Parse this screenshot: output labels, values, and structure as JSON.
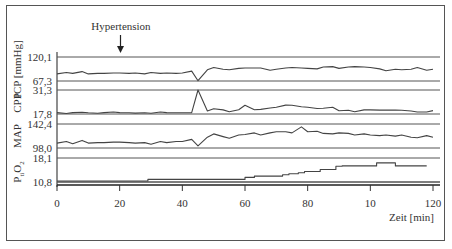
{
  "chart_data": {
    "type": "line",
    "title": "",
    "annotation": {
      "text": "Hypertension",
      "x": 20,
      "marker": "arrow-down"
    },
    "xlabel": "Zeit [min]",
    "x_ticks": [
      "0",
      "20",
      "40",
      "60",
      "80",
      "10",
      "120"
    ],
    "x_tick_values": [
      0,
      20,
      40,
      60,
      80,
      100,
      120
    ],
    "xlim": [
      0,
      120
    ],
    "ylabel_unit": "[mmHg]",
    "grid": "horizontal reference lines per panel",
    "legend": "none",
    "panels": [
      {
        "name": "ICP",
        "label": "ICP",
        "unit": "[mmHg]",
        "ymax": 120.1,
        "ymin": 67.3,
        "ymax_label": "120,1",
        "ymin_label": "67,3"
      },
      {
        "name": "CPP",
        "label": "CPP",
        "ymax": 31.3,
        "ymin": 17.8,
        "ymax_label": "31,3",
        "ymin_label": "17,8"
      },
      {
        "name": "MAP",
        "label": "MAP",
        "ymax": 142.4,
        "ymin": 98.0,
        "ymax_label": "142,4",
        "ymin_label": "98,0"
      },
      {
        "name": "PtiO2",
        "label": "PtiO2",
        "ymax": 18.1,
        "ymin": 10.8,
        "ymax_label": "18,1",
        "ymin_label": "10,8"
      }
    ],
    "series": [
      {
        "name": "ICP",
        "x": [
          0,
          3,
          5,
          8,
          10,
          13,
          15,
          18,
          20,
          23,
          25,
          28,
          30,
          33,
          35,
          38,
          40,
          43,
          45,
          48,
          50,
          53,
          55,
          58,
          60,
          63,
          65,
          68,
          70,
          73,
          75,
          78,
          80,
          83,
          85,
          88,
          90,
          93,
          95,
          98,
          100,
          103,
          105,
          108,
          110,
          113,
          115,
          118,
          120
        ],
        "values": [
          83,
          86,
          84,
          88,
          83,
          84,
          84,
          85,
          85,
          84,
          85,
          83,
          86,
          84,
          85,
          84,
          85,
          89,
          68,
          92,
          97,
          93,
          92,
          95,
          96,
          96,
          96,
          91,
          93,
          96,
          97,
          96,
          95,
          94,
          98,
          99,
          95,
          98,
          99,
          98,
          97,
          94,
          90,
          93,
          92,
          93,
          97,
          91,
          93
        ]
      },
      {
        "name": "CPP",
        "x": [
          0,
          3,
          5,
          8,
          10,
          13,
          15,
          18,
          20,
          23,
          25,
          28,
          30,
          33,
          35,
          38,
          40,
          43,
          45,
          48,
          50,
          53,
          55,
          58,
          60,
          63,
          65,
          68,
          70,
          73,
          75,
          78,
          80,
          83,
          85,
          88,
          90,
          93,
          95,
          98,
          100,
          103,
          105,
          108,
          110,
          113,
          115,
          118,
          120
        ],
        "values": [
          18.6,
          18.1,
          18.6,
          18.8,
          18.5,
          18.2,
          18.6,
          18.9,
          18.6,
          18.5,
          18.3,
          18.5,
          18.2,
          18.9,
          18.6,
          18.5,
          18.5,
          18.6,
          31.3,
          19.5,
          20.7,
          20.1,
          19.1,
          20.2,
          22.7,
          20.2,
          20.4,
          21.2,
          21.6,
          22.8,
          22.7,
          21.9,
          21.6,
          20.9,
          21.0,
          21.6,
          19.6,
          19.9,
          19.1,
          20.1,
          20.1,
          20.0,
          20.0,
          20.0,
          19.9,
          19.5,
          18.9,
          18.9,
          19.7
        ]
      },
      {
        "name": "MAP",
        "x": [
          0,
          3,
          5,
          8,
          10,
          13,
          15,
          18,
          20,
          23,
          25,
          28,
          30,
          33,
          35,
          38,
          40,
          43,
          45,
          48,
          50,
          53,
          55,
          58,
          60,
          63,
          65,
          68,
          70,
          73,
          75,
          78,
          80,
          83,
          85,
          88,
          90,
          93,
          95,
          98,
          100,
          103,
          105,
          108,
          110,
          113,
          115,
          118,
          120
        ],
        "values": [
          107,
          110,
          106,
          112,
          107,
          108,
          108,
          109,
          109,
          108,
          107,
          108,
          105,
          110,
          108,
          110,
          110,
          114,
          102,
          118,
          124,
          119,
          116,
          122,
          123,
          126,
          122,
          126,
          128,
          128,
          126,
          137,
          128,
          129,
          125,
          124,
          126,
          125,
          122,
          124,
          122,
          121,
          122,
          120,
          122,
          118,
          117,
          121,
          118
        ]
      },
      {
        "name": "PtiO2",
        "step": true,
        "x": [
          0,
          27,
          29,
          45,
          47,
          58,
          60,
          63,
          65,
          72,
          74,
          77,
          79,
          84,
          86,
          89,
          91,
          100,
          102,
          106,
          108,
          115,
          118
        ],
        "values": [
          11.1,
          11.1,
          11.6,
          11.6,
          11.6,
          11.6,
          12.2,
          12.6,
          12.6,
          13.0,
          13.3,
          13.6,
          14.0,
          14.6,
          14.6,
          15.6,
          15.7,
          15.7,
          16.6,
          16.6,
          15.7,
          15.7,
          15.7
        ]
      }
    ]
  },
  "ui": {
    "annotation_text": "Hypertension",
    "x_axis_title": "Zeit [min]",
    "y_unit": "[mmHg]",
    "panel_labels": [
      "ICP",
      "CPP",
      "MAP",
      "PtiO2"
    ]
  }
}
